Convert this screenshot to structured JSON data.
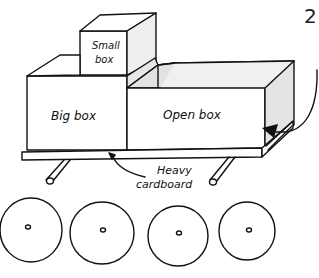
{
  "figure": {
    "step_number": "2",
    "labels": {
      "small_box_line1": "Small",
      "small_box_line2": "box",
      "big_box": "Big box",
      "open_box": "Open box",
      "heavy_cardboard_line1": "Heavy",
      "heavy_cardboard_line2": "cardboard"
    },
    "wheel_count": 4,
    "axle_count": 2,
    "colors": {
      "ink": "#111111",
      "shade": "#e4e4e4",
      "background": "#ffffff"
    }
  }
}
